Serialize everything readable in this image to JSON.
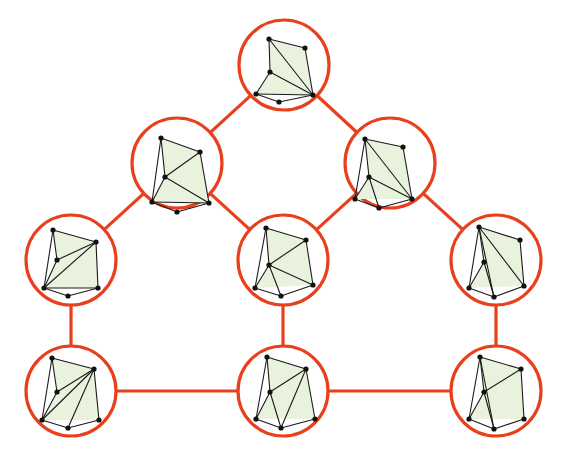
{
  "figure": {
    "width": 569,
    "height": 457,
    "background_color": "#ffffff"
  },
  "style": {
    "circle_stroke_color": "#e8401c",
    "circle_stroke_width": 3.2,
    "circle_fill_color": "#ffffff",
    "circle_radius": 45,
    "meta_edge_color": "#e8401c",
    "meta_edge_width": 3.2,
    "inner_face_fill": "#e9f2dd",
    "inner_edge_color": "#1a1a1a",
    "inner_edge_width": 1.1,
    "inner_vertex_color": "#111111",
    "inner_vertex_radius": 2.6
  },
  "meta_graph": {
    "type": "undirected",
    "node_count": 9,
    "edge_count": 10,
    "nodes": [
      {
        "id": "n-top",
        "label": "top",
        "cx": 284,
        "cy": 65,
        "r": 45
      },
      {
        "id": "n-upper-left",
        "label": "upper-left",
        "cx": 177,
        "cy": 163,
        "r": 45
      },
      {
        "id": "n-upper-right",
        "label": "upper-right",
        "cx": 390,
        "cy": 163,
        "r": 45
      },
      {
        "id": "n-mid-left",
        "label": "mid-left",
        "cx": 71,
        "cy": 260,
        "r": 45
      },
      {
        "id": "n-mid-center",
        "label": "mid-center",
        "cx": 283,
        "cy": 260,
        "r": 45
      },
      {
        "id": "n-mid-right",
        "label": "mid-right",
        "cx": 496,
        "cy": 260,
        "r": 45
      },
      {
        "id": "n-bottom-left",
        "label": "bottom-left",
        "cx": 71,
        "cy": 391,
        "r": 45
      },
      {
        "id": "n-bottom-center",
        "label": "bottom-center",
        "cx": 283,
        "cy": 391,
        "r": 45
      },
      {
        "id": "n-bottom-right",
        "label": "bottom-right",
        "cx": 496,
        "cy": 391,
        "r": 45
      }
    ],
    "edges": [
      {
        "id": "e1",
        "source": "n-top",
        "target": "n-upper-left"
      },
      {
        "id": "e2",
        "source": "n-top",
        "target": "n-upper-right"
      },
      {
        "id": "e3",
        "source": "n-upper-left",
        "target": "n-mid-left"
      },
      {
        "id": "e4",
        "source": "n-upper-left",
        "target": "n-mid-center"
      },
      {
        "id": "e5",
        "source": "n-upper-right",
        "target": "n-mid-center"
      },
      {
        "id": "e6",
        "source": "n-upper-right",
        "target": "n-mid-right"
      },
      {
        "id": "e7",
        "source": "n-mid-left",
        "target": "n-bottom-left"
      },
      {
        "id": "e8",
        "source": "n-mid-center",
        "target": "n-bottom-center"
      },
      {
        "id": "e9",
        "source": "n-mid-right",
        "target": "n-bottom-right"
      },
      {
        "id": "e10",
        "source": "n-bottom-left",
        "target": "n-bottom-center"
      },
      {
        "id": "e11",
        "source": "n-bottom-center",
        "target": "n-bottom-right"
      }
    ]
  },
  "inner_graphs": {
    "n-top": {
      "name": "inner-graph-top",
      "vertices": [
        {
          "id": "a",
          "x": 269,
          "y": 39
        },
        {
          "id": "b",
          "x": 305,
          "y": 48
        },
        {
          "id": "c",
          "x": 270,
          "y": 72
        },
        {
          "id": "d",
          "x": 256,
          "y": 94
        },
        {
          "id": "e",
          "x": 313,
          "y": 95
        },
        {
          "id": "f",
          "x": 279,
          "y": 102
        }
      ],
      "faces": [
        [
          "a",
          "b",
          "e",
          "d",
          "c"
        ]
      ],
      "edges": [
        [
          "a",
          "b"
        ],
        [
          "a",
          "c"
        ],
        [
          "a",
          "e"
        ],
        [
          "b",
          "e"
        ],
        [
          "c",
          "d"
        ],
        [
          "c",
          "e"
        ],
        [
          "d",
          "e"
        ],
        [
          "d",
          "f"
        ],
        [
          "f",
          "e"
        ]
      ]
    },
    "n-upper-left": {
      "name": "inner-graph-upper-left",
      "vertices": [
        {
          "id": "a",
          "x": 161,
          "y": 138
        },
        {
          "id": "b",
          "x": 200,
          "y": 152
        },
        {
          "id": "c",
          "x": 165,
          "y": 177
        },
        {
          "id": "d",
          "x": 152,
          "y": 202
        },
        {
          "id": "e",
          "x": 209,
          "y": 203
        },
        {
          "id": "f",
          "x": 177,
          "y": 212
        }
      ],
      "faces": [
        [
          "a",
          "b",
          "e",
          "d",
          "c"
        ]
      ],
      "edges": [
        [
          "a",
          "b"
        ],
        [
          "a",
          "c"
        ],
        [
          "a",
          "d"
        ],
        [
          "b",
          "c"
        ],
        [
          "b",
          "e"
        ],
        [
          "c",
          "d"
        ],
        [
          "c",
          "e"
        ],
        [
          "d",
          "e"
        ],
        [
          "d",
          "f"
        ],
        [
          "f",
          "e"
        ]
      ]
    },
    "n-upper-right": {
      "name": "inner-graph-upper-right",
      "vertices": [
        {
          "id": "a",
          "x": 365,
          "y": 139
        },
        {
          "id": "b",
          "x": 403,
          "y": 147
        },
        {
          "id": "c",
          "x": 369,
          "y": 177
        },
        {
          "id": "d",
          "x": 355,
          "y": 199
        },
        {
          "id": "e",
          "x": 412,
          "y": 199
        },
        {
          "id": "f",
          "x": 379,
          "y": 208
        }
      ],
      "faces": [
        [
          "a",
          "b",
          "e",
          "d",
          "c"
        ]
      ],
      "edges": [
        [
          "a",
          "b"
        ],
        [
          "a",
          "c"
        ],
        [
          "a",
          "d"
        ],
        [
          "a",
          "e"
        ],
        [
          "b",
          "e"
        ],
        [
          "c",
          "d"
        ],
        [
          "c",
          "e"
        ],
        [
          "d",
          "f"
        ],
        [
          "c",
          "f"
        ],
        [
          "f",
          "e"
        ]
      ]
    },
    "n-mid-left": {
      "name": "inner-graph-mid-left",
      "vertices": [
        {
          "id": "a",
          "x": 53,
          "y": 230
        },
        {
          "id": "b",
          "x": 96,
          "y": 242
        },
        {
          "id": "c",
          "x": 57,
          "y": 260
        },
        {
          "id": "d",
          "x": 44,
          "y": 288
        },
        {
          "id": "e",
          "x": 98,
          "y": 288
        },
        {
          "id": "f",
          "x": 68,
          "y": 296
        }
      ],
      "faces": [
        [
          "a",
          "b",
          "e",
          "d",
          "c"
        ]
      ],
      "edges": [
        [
          "a",
          "b"
        ],
        [
          "a",
          "c"
        ],
        [
          "a",
          "d"
        ],
        [
          "b",
          "c"
        ],
        [
          "b",
          "d"
        ],
        [
          "b",
          "e"
        ],
        [
          "c",
          "d"
        ],
        [
          "d",
          "e"
        ],
        [
          "d",
          "f"
        ],
        [
          "f",
          "e"
        ]
      ]
    },
    "n-mid-center": {
      "name": "inner-graph-mid-center",
      "vertices": [
        {
          "id": "a",
          "x": 266,
          "y": 228
        },
        {
          "id": "b",
          "x": 306,
          "y": 240
        },
        {
          "id": "c",
          "x": 269,
          "y": 265
        },
        {
          "id": "d",
          "x": 255,
          "y": 288
        },
        {
          "id": "e",
          "x": 313,
          "y": 285
        },
        {
          "id": "f",
          "x": 281,
          "y": 296
        }
      ],
      "faces": [
        [
          "a",
          "b",
          "e",
          "d",
          "c"
        ]
      ],
      "edges": [
        [
          "a",
          "b"
        ],
        [
          "a",
          "c"
        ],
        [
          "a",
          "d"
        ],
        [
          "b",
          "c"
        ],
        [
          "b",
          "e"
        ],
        [
          "c",
          "d"
        ],
        [
          "c",
          "e"
        ],
        [
          "c",
          "f"
        ],
        [
          "d",
          "f"
        ],
        [
          "f",
          "e"
        ]
      ]
    },
    "n-mid-right": {
      "name": "inner-graph-mid-right",
      "vertices": [
        {
          "id": "a",
          "x": 479,
          "y": 227
        },
        {
          "id": "b",
          "x": 520,
          "y": 240
        },
        {
          "id": "c",
          "x": 484,
          "y": 262
        },
        {
          "id": "d",
          "x": 469,
          "y": 288
        },
        {
          "id": "e",
          "x": 524,
          "y": 286
        },
        {
          "id": "f",
          "x": 494,
          "y": 297
        }
      ],
      "faces": [
        [
          "a",
          "b",
          "e",
          "d",
          "c"
        ]
      ],
      "edges": [
        [
          "a",
          "b"
        ],
        [
          "a",
          "c"
        ],
        [
          "a",
          "d"
        ],
        [
          "a",
          "e"
        ],
        [
          "a",
          "f"
        ],
        [
          "b",
          "e"
        ],
        [
          "c",
          "d"
        ],
        [
          "c",
          "f"
        ],
        [
          "d",
          "f"
        ],
        [
          "f",
          "e"
        ]
      ]
    },
    "n-bottom-left": {
      "name": "inner-graph-bottom-left",
      "vertices": [
        {
          "id": "a",
          "x": 52,
          "y": 358
        },
        {
          "id": "b",
          "x": 94,
          "y": 369
        },
        {
          "id": "c",
          "x": 57,
          "y": 392
        },
        {
          "id": "d",
          "x": 42,
          "y": 420
        },
        {
          "id": "e",
          "x": 99,
          "y": 420
        },
        {
          "id": "f",
          "x": 68,
          "y": 428
        }
      ],
      "faces": [
        [
          "a",
          "b",
          "e",
          "d",
          "c"
        ]
      ],
      "edges": [
        [
          "a",
          "b"
        ],
        [
          "a",
          "c"
        ],
        [
          "a",
          "d"
        ],
        [
          "b",
          "c"
        ],
        [
          "b",
          "d"
        ],
        [
          "b",
          "e"
        ],
        [
          "b",
          "f"
        ],
        [
          "c",
          "d"
        ],
        [
          "d",
          "f"
        ],
        [
          "f",
          "e"
        ]
      ]
    },
    "n-bottom-center": {
      "name": "inner-graph-bottom-center",
      "vertices": [
        {
          "id": "a",
          "x": 267,
          "y": 357
        },
        {
          "id": "b",
          "x": 306,
          "y": 369
        },
        {
          "id": "c",
          "x": 270,
          "y": 392
        },
        {
          "id": "d",
          "x": 256,
          "y": 419
        },
        {
          "id": "e",
          "x": 315,
          "y": 419
        },
        {
          "id": "f",
          "x": 281,
          "y": 428
        }
      ],
      "faces": [
        [
          "a",
          "b",
          "e",
          "d",
          "c"
        ]
      ],
      "edges": [
        [
          "a",
          "b"
        ],
        [
          "a",
          "c"
        ],
        [
          "a",
          "d"
        ],
        [
          "b",
          "c"
        ],
        [
          "b",
          "e"
        ],
        [
          "b",
          "f"
        ],
        [
          "c",
          "d"
        ],
        [
          "c",
          "f"
        ],
        [
          "d",
          "f"
        ],
        [
          "f",
          "e"
        ]
      ]
    },
    "n-bottom-right": {
      "name": "inner-graph-bottom-right",
      "vertices": [
        {
          "id": "a",
          "x": 480,
          "y": 357
        },
        {
          "id": "b",
          "x": 521,
          "y": 369
        },
        {
          "id": "c",
          "x": 484,
          "y": 392
        },
        {
          "id": "d",
          "x": 469,
          "y": 419
        },
        {
          "id": "e",
          "x": 524,
          "y": 419
        },
        {
          "id": "f",
          "x": 494,
          "y": 429
        }
      ],
      "faces": [
        [
          "a",
          "b",
          "e",
          "d",
          "c"
        ]
      ],
      "edges": [
        [
          "a",
          "b"
        ],
        [
          "a",
          "c"
        ],
        [
          "a",
          "d"
        ],
        [
          "a",
          "f"
        ],
        [
          "b",
          "c"
        ],
        [
          "b",
          "e"
        ],
        [
          "c",
          "d"
        ],
        [
          "c",
          "f"
        ],
        [
          "d",
          "f"
        ],
        [
          "f",
          "e"
        ]
      ]
    }
  }
}
